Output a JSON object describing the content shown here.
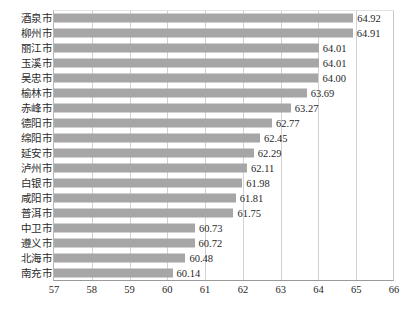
{
  "chart_data": {
    "type": "bar",
    "orientation": "horizontal",
    "title": "",
    "subtitle": "",
    "xlabel": "",
    "ylabel": "",
    "xlim": [
      57,
      66
    ],
    "xticks": [
      "57",
      "58",
      "59",
      "60",
      "61",
      "62",
      "63",
      "64",
      "65",
      "66"
    ],
    "grid": "vertical",
    "legend": "none",
    "bar_color": "#a6a6a6",
    "categories": [
      "酒泉市",
      "柳州市",
      "丽江市",
      "玉溪市",
      "吴忠市",
      "榆林市",
      "赤峰市",
      "德阳市",
      "绵阳市",
      "延安市",
      "泸州市",
      "白银市",
      "咸阳市",
      "普洱市",
      "中卫市",
      "遵义市",
      "北海市",
      "南充市"
    ],
    "values": [
      64.92,
      64.91,
      64.01,
      64.01,
      64.0,
      63.69,
      63.27,
      62.77,
      62.45,
      62.29,
      62.11,
      61.98,
      61.81,
      61.75,
      60.73,
      60.72,
      60.48,
      60.14
    ],
    "value_labels": [
      "64.92",
      "64.91",
      "64.01",
      "64.01",
      "64.00",
      "63.69",
      "63.27",
      "62.77",
      "62.45",
      "62.29",
      "62.11",
      "61.98",
      "61.81",
      "61.75",
      "60.73",
      "60.72",
      "60.48",
      "60.14"
    ]
  }
}
